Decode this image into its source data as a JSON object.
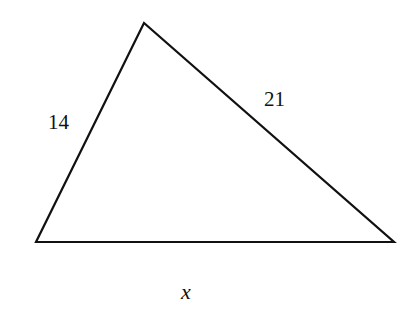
{
  "diagram": {
    "type": "triangle",
    "stroke_color": "#111111",
    "background": "#ffffff",
    "vertices": {
      "top": [
        144,
        23
      ],
      "bottom_left": [
        36,
        242
      ],
      "bottom_right": [
        394,
        242
      ]
    },
    "sides": [
      {
        "id": "left",
        "from": "bottom_left",
        "to": "top",
        "label": "14"
      },
      {
        "id": "right",
        "from": "top",
        "to": "bottom_right",
        "label": "21"
      },
      {
        "id": "bottom",
        "from": "bottom_left",
        "to": "bottom_right",
        "label": "x"
      }
    ]
  }
}
